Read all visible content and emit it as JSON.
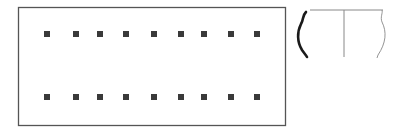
{
  "figure": {
    "plan": {
      "shape": "rectangle",
      "rect": {
        "x": 18.5,
        "y": 7.5,
        "width": 267,
        "height": 118
      },
      "stroke": "#555555",
      "rows": [
        {
          "y": 34,
          "x": [
            47,
            76,
            100,
            126,
            154,
            181,
            204,
            231,
            257
          ]
        },
        {
          "y": 97,
          "x": [
            47,
            76,
            100,
            126,
            154,
            181,
            204,
            231,
            257
          ]
        }
      ],
      "post_size": 6,
      "post_color": "#3a3a3a"
    },
    "vessel": {
      "type": "pottery-profile-half-section",
      "rim_y": 10,
      "rim_x1": 310,
      "rim_x2": 383,
      "axis_x": 344,
      "axis_y2": 57,
      "section_color": "#1a1a1a",
      "outline_color": "#888888"
    }
  }
}
